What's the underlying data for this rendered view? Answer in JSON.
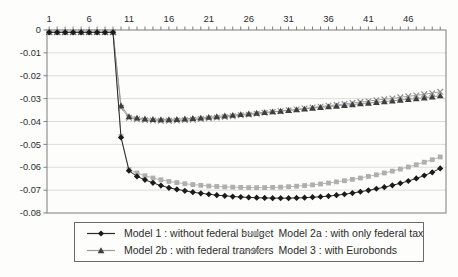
{
  "chart_data": {
    "type": "line",
    "title": "",
    "xlabel": "",
    "ylabel": "",
    "grid": true,
    "legend_position": "bottom-box",
    "ylim": [
      -0.08,
      0
    ],
    "y_ticks": [
      0,
      -0.01,
      -0.02,
      -0.03,
      -0.04,
      -0.05,
      -0.06,
      -0.07,
      -0.08
    ],
    "y_tick_labels": [
      "0",
      "-0.01",
      "-0.02",
      "-0.03",
      "-0.04",
      "-0.05",
      "-0.06",
      "-0.07",
      "-0.08"
    ],
    "x_ticks_labeled": [
      1,
      6,
      11,
      16,
      21,
      26,
      31,
      36,
      41,
      46
    ],
    "x": [
      1,
      2,
      3,
      4,
      5,
      6,
      7,
      8,
      9,
      10,
      11,
      12,
      13,
      14,
      15,
      16,
      17,
      18,
      19,
      20,
      21,
      22,
      23,
      24,
      25,
      26,
      27,
      28,
      29,
      30,
      31,
      32,
      33,
      34,
      35,
      36,
      37,
      38,
      39,
      40,
      41,
      42,
      43,
      44,
      45,
      46,
      47,
      48,
      49,
      50
    ],
    "series": [
      {
        "name": "model-1",
        "label": "Model 1 : without federal budget",
        "marker": "diamond",
        "marker_color": "#1b1b1b",
        "line_color": "#2a2a2a",
        "values": [
          -0.001,
          -0.001,
          -0.001,
          -0.001,
          -0.001,
          -0.001,
          -0.001,
          -0.001,
          -0.001,
          -0.047,
          -0.0615,
          -0.064,
          -0.0655,
          -0.0668,
          -0.068,
          -0.069,
          -0.0697,
          -0.0703,
          -0.0709,
          -0.0714,
          -0.0718,
          -0.0722,
          -0.0725,
          -0.0728,
          -0.073,
          -0.0732,
          -0.0733,
          -0.0734,
          -0.0735,
          -0.0735,
          -0.0735,
          -0.0734,
          -0.0733,
          -0.0731,
          -0.0729,
          -0.0726,
          -0.0722,
          -0.0718,
          -0.0713,
          -0.0707,
          -0.0701,
          -0.0694,
          -0.0687,
          -0.0679,
          -0.067,
          -0.066,
          -0.0649,
          -0.0636,
          -0.0622,
          -0.0605
        ]
      },
      {
        "name": "model-2a",
        "label": "Model 2a : with only federal tax",
        "marker": "square",
        "marker_color": "#afafaf",
        "line_color": "#b6b6b6",
        "values": [
          -0.001,
          -0.001,
          -0.001,
          -0.001,
          -0.001,
          -0.001,
          -0.001,
          -0.001,
          -0.001,
          -0.0465,
          -0.061,
          -0.0625,
          -0.0637,
          -0.0647,
          -0.0655,
          -0.0662,
          -0.0667,
          -0.0672,
          -0.0676,
          -0.0679,
          -0.0682,
          -0.0684,
          -0.0686,
          -0.0687,
          -0.0688,
          -0.0689,
          -0.0689,
          -0.0689,
          -0.0688,
          -0.0687,
          -0.0685,
          -0.0683,
          -0.068,
          -0.0677,
          -0.0673,
          -0.0669,
          -0.0664,
          -0.0659,
          -0.0653,
          -0.0647,
          -0.064,
          -0.0633,
          -0.0625,
          -0.0617,
          -0.0608,
          -0.0599,
          -0.0589,
          -0.0578,
          -0.0567,
          -0.0555
        ]
      },
      {
        "name": "model-2b",
        "label": "Model 2b : with federal transfers",
        "marker": "triangle",
        "marker_color": "#3e3e3e",
        "line_color": "#9b9b9b",
        "values": [
          -0.001,
          -0.001,
          -0.001,
          -0.001,
          -0.001,
          -0.001,
          -0.001,
          -0.001,
          -0.001,
          -0.033,
          -0.0378,
          -0.0384,
          -0.0388,
          -0.039,
          -0.0391,
          -0.0391,
          -0.039,
          -0.0388,
          -0.0386,
          -0.0384,
          -0.0381,
          -0.0378,
          -0.0375,
          -0.0372,
          -0.0369,
          -0.0366,
          -0.0363,
          -0.036,
          -0.0357,
          -0.0354,
          -0.0351,
          -0.0348,
          -0.0345,
          -0.0341,
          -0.0338,
          -0.0335,
          -0.0332,
          -0.0329,
          -0.0326,
          -0.0322,
          -0.0319,
          -0.0316,
          -0.0313,
          -0.031,
          -0.0306,
          -0.0303,
          -0.03,
          -0.0296,
          -0.0292,
          -0.0287
        ]
      },
      {
        "name": "model-3",
        "label": "Model 3 : with Eurobonds",
        "marker": "x",
        "marker_color": "#909090",
        "line_color": "#a2a2a2",
        "values": [
          -0.001,
          -0.001,
          -0.001,
          -0.001,
          -0.001,
          -0.001,
          -0.001,
          -0.001,
          -0.001,
          -0.034,
          -0.0384,
          -0.039,
          -0.0394,
          -0.0396,
          -0.0397,
          -0.0397,
          -0.0396,
          -0.0394,
          -0.0392,
          -0.0389,
          -0.0386,
          -0.0383,
          -0.038,
          -0.0377,
          -0.0373,
          -0.037,
          -0.0366,
          -0.0362,
          -0.0358,
          -0.0355,
          -0.0351,
          -0.0347,
          -0.0343,
          -0.0339,
          -0.0335,
          -0.0331,
          -0.0327,
          -0.0323,
          -0.0319,
          -0.0315,
          -0.0311,
          -0.0307,
          -0.0303,
          -0.0299,
          -0.0294,
          -0.029,
          -0.0286,
          -0.0281,
          -0.0276,
          -0.027
        ]
      }
    ]
  },
  "style_colors": {
    "axis": "#7d7d7d",
    "gridline": "#d8d8d5",
    "tick_text": "#2d2d2d",
    "background": "#fdfdfb",
    "legend_border": "#6a6a6a"
  }
}
